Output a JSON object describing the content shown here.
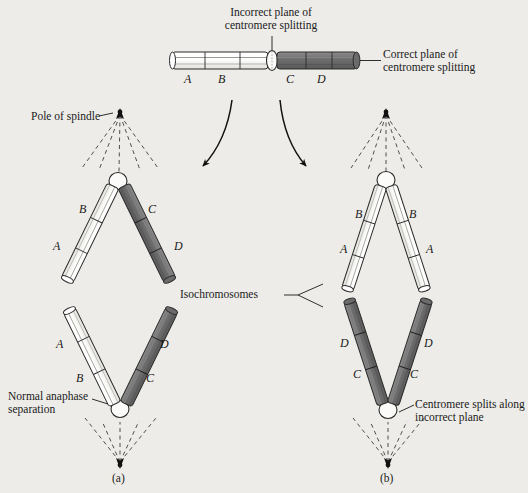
{
  "figure": {
    "background_color": "#edece8",
    "chromatid_light_color": "#fdfdfb",
    "chromatid_dark_color": "#6f6f6f",
    "outline_color": "#2b2b2b"
  },
  "labels": {
    "incorrect_plane": "Incorrect plane of\ncentromere splitting",
    "correct_plane": "Correct plane of\ncentromere splitting",
    "pole_of_spindle": "Pole of spindle",
    "normal_anaphase": "Normal anaphase\nseparation",
    "isochromosomes": "Isochromosomes",
    "incorrect_split": "Centromere splits along\nincorrect plane",
    "panel_a": "(a)",
    "panel_b": "(b)"
  },
  "top_chromosome": {
    "left_arm_segments": [
      "A",
      "B"
    ],
    "right_arm_segments": [
      "C",
      "D"
    ],
    "left_arm_shade": "light",
    "right_arm_shade": "dark"
  },
  "panel_a": {
    "name": "normal-centromere-splitting",
    "upper_chromosome": {
      "left_arm": {
        "shade": "light",
        "segments": [
          "B",
          "A"
        ]
      },
      "right_arm": {
        "shade": "dark",
        "segments": [
          "C",
          "D"
        ]
      }
    },
    "lower_chromosome": {
      "left_arm": {
        "shade": "light",
        "segments": [
          "A",
          "B"
        ]
      },
      "right_arm": {
        "shade": "dark",
        "segments": [
          "D",
          "C"
        ]
      }
    }
  },
  "panel_b": {
    "name": "isochromosome-formation",
    "upper_chromosome": {
      "left_arm": {
        "shade": "light",
        "segments": [
          "B",
          "A"
        ]
      },
      "right_arm": {
        "shade": "light",
        "segments": [
          "B",
          "A"
        ]
      }
    },
    "lower_chromosome": {
      "left_arm": {
        "shade": "dark",
        "segments": [
          "D",
          "C"
        ]
      },
      "right_arm": {
        "shade": "dark",
        "segments": [
          "D",
          "C"
        ]
      }
    }
  },
  "segment_letters": {
    "top_A": "A",
    "top_B": "B",
    "top_C": "C",
    "top_D": "D",
    "a_up_B": "B",
    "a_up_A": "A",
    "a_up_C": "C",
    "a_up_D": "D",
    "a_lo_A": "A",
    "a_lo_B": "B",
    "a_lo_D": "D",
    "a_lo_C": "C",
    "b_up_Bl": "B",
    "b_up_Al": "A",
    "b_up_Br": "B",
    "b_up_Ar": "A",
    "b_lo_Dl": "D",
    "b_lo_Cl": "C",
    "b_lo_Dr": "D",
    "b_lo_Cr": "C"
  }
}
